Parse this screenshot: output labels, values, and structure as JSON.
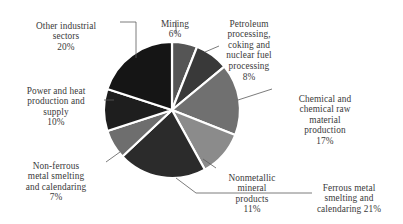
{
  "chart_data": {
    "type": "pie",
    "title": "",
    "subtitle": "",
    "xlabel": "",
    "ylabel": "",
    "grid": false,
    "legend_position": "callout-labels",
    "units": "percent",
    "start_angle_deg": 0,
    "direction": "clockwise",
    "categories": [
      "Mining",
      "Petroleum processing, coking and nuclear fuel processing",
      "Chemical and chemical raw material production",
      "Nonmetallic mineral products",
      "Ferrous metal smelting and calendaring",
      "Non-ferrous metal smelting and calendaring",
      "Power and heat production and supply",
      "Other industrial sectors"
    ],
    "values": [
      6,
      8,
      17,
      11,
      21,
      7,
      10,
      20
    ],
    "colors": [
      "#555555",
      "#393939",
      "#707070",
      "#8b8b8b",
      "#2b2b2b",
      "#6e6e6e",
      "#1e1e1e",
      "#151515"
    ],
    "separator_color": "#ffffff",
    "slice_labels": [
      "6%",
      "8%",
      "17%",
      "11%",
      "21%",
      "7%",
      "10%",
      "20%"
    ]
  },
  "labels": {
    "other_industrial": {
      "text": "Other industrial\nsectors",
      "pct": "20%"
    },
    "mining": {
      "text": "Mining",
      "pct": "6%"
    },
    "petroleum": {
      "text": "Petroleum\nprocessing,\ncoking and\nnuclear fuel\nprocessing",
      "pct": "8%"
    },
    "chemical": {
      "text": "Chemical and\nchemical raw\nmaterial\nproduction",
      "pct": "17%"
    },
    "ferrous": {
      "text": "Ferrous metal\nsmelting and\ncalendaring 21%",
      "pct": ""
    },
    "nonmetallic": {
      "text": "Nonmetallic\nmineral\nproducts",
      "pct": "11%"
    },
    "nonferrous": {
      "text": "Non-ferrous\nmetal smelting\nand calendaring",
      "pct": "7%"
    },
    "power_heat": {
      "text": "Power and heat\nproduction and\nsupply",
      "pct": "10%"
    }
  }
}
